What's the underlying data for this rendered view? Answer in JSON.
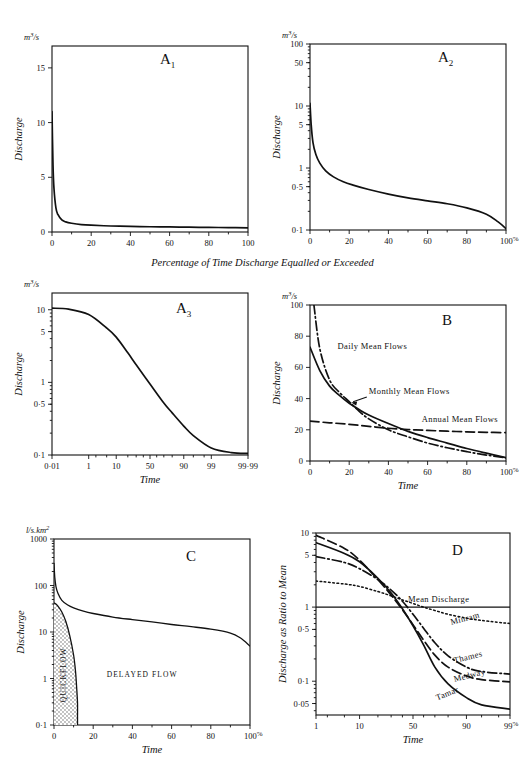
{
  "figure": {
    "shared_caption": "Percentage of Time Discharge Equalled or Exceeded",
    "axis_titles": {
      "discharge": "Discharge",
      "time": "Time",
      "ratio": "Discharge as Ratio to Mean"
    },
    "units": {
      "cumecs": "m3/s",
      "specific": "l/s.km2"
    }
  },
  "chart_data": [
    {
      "id": "A1",
      "type": "line",
      "panel_label": "A",
      "panel_sub": "1",
      "title": "Flow duration curve, arithmetic scales",
      "xlabel": "",
      "ylabel": "Discharge",
      "yunits": "m3/s",
      "xscale": "linear",
      "yscale": "linear",
      "xlim": [
        0,
        100
      ],
      "ylim": [
        0,
        17
      ],
      "xticks": [
        0,
        20,
        40,
        60,
        80,
        100
      ],
      "xticklabels": [
        "0",
        "20",
        "40",
        "60",
        "80",
        "100"
      ],
      "yticks": [
        0,
        5,
        10,
        15
      ],
      "yticklabels": [
        "0",
        "5",
        "10",
        "15"
      ],
      "series": [
        {
          "name": "flow duration",
          "x": [
            0,
            0.5,
            1,
            2,
            3,
            5,
            7,
            10,
            15,
            20,
            30,
            40,
            50,
            60,
            70,
            80,
            90,
            100
          ],
          "y": [
            11.0,
            6.2,
            4.0,
            2.2,
            1.6,
            1.1,
            0.92,
            0.8,
            0.68,
            0.62,
            0.55,
            0.51,
            0.48,
            0.46,
            0.44,
            0.42,
            0.4,
            0.38
          ]
        }
      ]
    },
    {
      "id": "A2",
      "type": "line",
      "panel_label": "A",
      "panel_sub": "2",
      "title": "Flow duration curve, logarithmic discharge scale",
      "xlabel": "",
      "ylabel": "Discharge",
      "yunits": "m3/s",
      "xscale": "linear",
      "yscale": "log",
      "xlim": [
        0,
        100
      ],
      "ylim": [
        0.1,
        100
      ],
      "xticks": [
        0,
        20,
        40,
        60,
        80,
        100
      ],
      "xticklabels": [
        "0",
        "20",
        "40",
        "60",
        "80",
        "100"
      ],
      "x_axis_suffix": "%",
      "yticks": [
        0.1,
        0.5,
        1,
        5,
        10,
        50,
        100
      ],
      "yticklabels": [
        "0·1",
        "0·5",
        "1",
        "5",
        "10",
        "50",
        "100"
      ],
      "series": [
        {
          "name": "flow duration",
          "x": [
            0,
            0.6,
            1.5,
            3,
            5,
            8,
            12,
            17,
            22,
            30,
            40,
            50,
            60,
            70,
            80,
            90,
            96,
            100
          ],
          "y": [
            11.0,
            5.0,
            2.6,
            1.65,
            1.2,
            0.9,
            0.72,
            0.6,
            0.53,
            0.45,
            0.38,
            0.33,
            0.295,
            0.265,
            0.228,
            0.18,
            0.135,
            0.105
          ]
        }
      ]
    },
    {
      "id": "A3",
      "type": "line",
      "panel_label": "A",
      "panel_sub": "3",
      "title": "Flow duration curve, log-probability scales",
      "xlabel": "Time",
      "ylabel": "Discharge",
      "yunits": "m3/s",
      "xscale": "probability",
      "yscale": "log",
      "xlim": [
        0.01,
        99.99
      ],
      "ylim": [
        0.1,
        17
      ],
      "xticks": [
        0.01,
        1,
        10,
        50,
        90,
        99,
        99.99
      ],
      "xticklabels": [
        "0·01",
        "1",
        "10",
        "50",
        "90",
        "99",
        "99·99"
      ],
      "yticks": [
        0.1,
        0.5,
        1,
        5,
        10
      ],
      "yticklabels": [
        "0·1",
        "0·5",
        "1",
        "5",
        "10"
      ],
      "series": [
        {
          "name": "flow duration",
          "x": [
            0.01,
            0.1,
            1,
            5,
            10,
            20,
            30,
            50,
            70,
            80,
            90,
            95,
            99,
            99.9,
            99.99
          ],
          "y": [
            10.5,
            10.2,
            8.6,
            5.6,
            4.2,
            2.55,
            1.75,
            0.95,
            0.52,
            0.38,
            0.25,
            0.185,
            0.125,
            0.108,
            0.105
          ]
        }
      ]
    },
    {
      "id": "B",
      "type": "line",
      "panel_label": "B",
      "panel_sub": "",
      "title": "Effect of averaging period on flow duration curves",
      "xlabel": "Time",
      "ylabel": "Discharge",
      "yunits": "m3/s",
      "xscale": "linear",
      "yscale": "linear",
      "xlim": [
        0,
        100
      ],
      "ylim": [
        0,
        100
      ],
      "xticks": [
        0,
        20,
        40,
        60,
        80,
        100
      ],
      "xticklabels": [
        "0",
        "20",
        "40",
        "60",
        "80",
        "100"
      ],
      "x_axis_suffix": "%",
      "yticks": [
        0,
        20,
        40,
        60,
        80,
        100
      ],
      "yticklabels": [
        "0",
        "20",
        "40",
        "60",
        "80",
        "100"
      ],
      "series": [
        {
          "name": "Daily Mean Flows",
          "style": "dashdot",
          "x": [
            2,
            5,
            10,
            15,
            20,
            25,
            30,
            40,
            50,
            60,
            70,
            80,
            90,
            100
          ],
          "y": [
            100,
            72,
            52,
            44,
            38,
            32,
            27,
            20,
            15.5,
            11.5,
            8.5,
            6.0,
            3.8,
            2.0
          ]
        },
        {
          "name": "Monthly Mean Flows",
          "style": "solid",
          "x": [
            0,
            5,
            10,
            15,
            20,
            25,
            30,
            40,
            50,
            60,
            70,
            80,
            90,
            100
          ],
          "y": [
            73,
            58,
            48,
            42,
            37,
            33,
            29.5,
            24,
            19,
            15,
            11.5,
            8.0,
            5.0,
            2.2
          ]
        },
        {
          "name": "Annual Mean Flows",
          "style": "dashed",
          "x": [
            0,
            10,
            20,
            30,
            40,
            50,
            60,
            70,
            80,
            90,
            100
          ],
          "y": [
            25.5,
            24.5,
            23.5,
            22.2,
            21.0,
            20.2,
            19.6,
            19.1,
            18.7,
            18.4,
            18.2
          ]
        }
      ],
      "annotations": [
        {
          "text": "Daily Mean Flows",
          "x": 14,
          "y": 72
        },
        {
          "text": "Monthly Mean Flows",
          "x": 30,
          "y": 43
        },
        {
          "text": "Annual Mean Flows",
          "x": 57,
          "y": 25
        }
      ]
    },
    {
      "id": "C",
      "type": "area",
      "panel_label": "C",
      "panel_sub": "",
      "title": "Flow duration curve separated into quickflow and delayed flow",
      "xlabel": "Time",
      "ylabel": "Discharge",
      "yunits": "l/s.km2",
      "xscale": "linear",
      "yscale": "log",
      "xlim": [
        0,
        100
      ],
      "ylim": [
        0.1,
        1000
      ],
      "xticks": [
        0,
        20,
        40,
        60,
        80,
        100
      ],
      "xticklabels": [
        "0",
        "20",
        "40",
        "60",
        "80",
        "100"
      ],
      "x_axis_suffix": "%",
      "yticks": [
        0.1,
        1,
        10,
        100,
        1000
      ],
      "yticklabels": [
        "0·1",
        "1",
        "10",
        "100",
        "1000"
      ],
      "series": [
        {
          "name": "total flow",
          "style": "solid",
          "x": [
            0,
            0.4,
            1,
            2,
            4,
            7,
            10,
            15,
            20,
            30,
            40,
            50,
            60,
            70,
            80,
            90,
            95,
            100
          ],
          "y": [
            300,
            150,
            95,
            68,
            48,
            38,
            33,
            28,
            25,
            21,
            18.5,
            16.5,
            14.5,
            13,
            11.5,
            9.5,
            7.5,
            5.0
          ]
        },
        {
          "name": "quickflow boundary",
          "style": "solid",
          "x": [
            0,
            1,
            2,
            4,
            6,
            8,
            10,
            11,
            11.6,
            12,
            12,
            12
          ],
          "y": [
            42,
            40,
            36,
            27,
            17,
            8.5,
            3.2,
            1.4,
            0.6,
            0.3,
            0.15,
            0.1
          ]
        }
      ],
      "region_labels": [
        {
          "text": "QUICKFLOW",
          "orientation": "vertical",
          "x": 6,
          "y": 1.2
        },
        {
          "text": "DELAYED FLOW",
          "orientation": "horizontal",
          "x": 45,
          "y": 1.1
        }
      ]
    },
    {
      "id": "D",
      "type": "line",
      "panel_label": "D",
      "panel_sub": "",
      "title": "Flow duration curves for four rivers, discharge as ratio to mean",
      "xlabel": "Time",
      "ylabel": "Discharge as Ratio to Mean",
      "yunits": "",
      "xscale": "probability",
      "yscale": "log",
      "xlim": [
        1,
        99
      ],
      "ylim": [
        0.035,
        10
      ],
      "xticks": [
        1,
        10,
        50,
        90,
        99
      ],
      "xticklabels": [
        "1",
        "10",
        "50",
        "90",
        "99"
      ],
      "x_axis_suffix": "%",
      "yticks": [
        0.05,
        0.1,
        0.5,
        1,
        5,
        10
      ],
      "yticklabels": [
        "0·05",
        "0·1",
        "0·5",
        "1",
        "5",
        "10"
      ],
      "reference_line": {
        "label": "Mean Discharge",
        "y": 1
      },
      "series": [
        {
          "name": "Minram",
          "style": "dotted",
          "x": [
            1,
            5,
            10,
            20,
            30,
            40,
            50,
            60,
            70,
            80,
            90,
            95,
            99
          ],
          "y": [
            2.25,
            2.05,
            1.9,
            1.62,
            1.42,
            1.25,
            1.12,
            1.0,
            0.9,
            0.8,
            0.71,
            0.66,
            0.6
          ]
        },
        {
          "name": "Thames",
          "style": "dashdot",
          "x": [
            1,
            5,
            10,
            20,
            30,
            40,
            50,
            60,
            70,
            80,
            90,
            95,
            99
          ],
          "y": [
            4.8,
            4.0,
            3.3,
            2.35,
            1.7,
            1.2,
            0.8,
            0.52,
            0.33,
            0.22,
            0.155,
            0.135,
            0.125
          ]
        },
        {
          "name": "Medway",
          "style": "dashed",
          "x": [
            1,
            5,
            10,
            20,
            30,
            40,
            50,
            60,
            70,
            80,
            90,
            95,
            99
          ],
          "y": [
            9.3,
            6.2,
            4.3,
            2.35,
            1.45,
            0.92,
            0.58,
            0.36,
            0.225,
            0.155,
            0.118,
            0.105,
            0.098
          ]
        },
        {
          "name": "Tamar",
          "style": "solid",
          "x": [
            1,
            5,
            10,
            20,
            30,
            40,
            50,
            60,
            70,
            80,
            90,
            95,
            99
          ],
          "y": [
            7.4,
            5.3,
            4.1,
            2.45,
            1.55,
            0.95,
            0.56,
            0.31,
            0.155,
            0.092,
            0.06,
            0.048,
            0.042
          ]
        }
      ],
      "annotations": [
        {
          "text": "Minram",
          "x": 82,
          "y": 0.58
        },
        {
          "text": "Thames",
          "x": 84,
          "y": 0.175
        },
        {
          "text": "Medway",
          "x": 84,
          "y": 0.098
        },
        {
          "text": "Tamar",
          "x": 72,
          "y": 0.055
        }
      ]
    }
  ]
}
